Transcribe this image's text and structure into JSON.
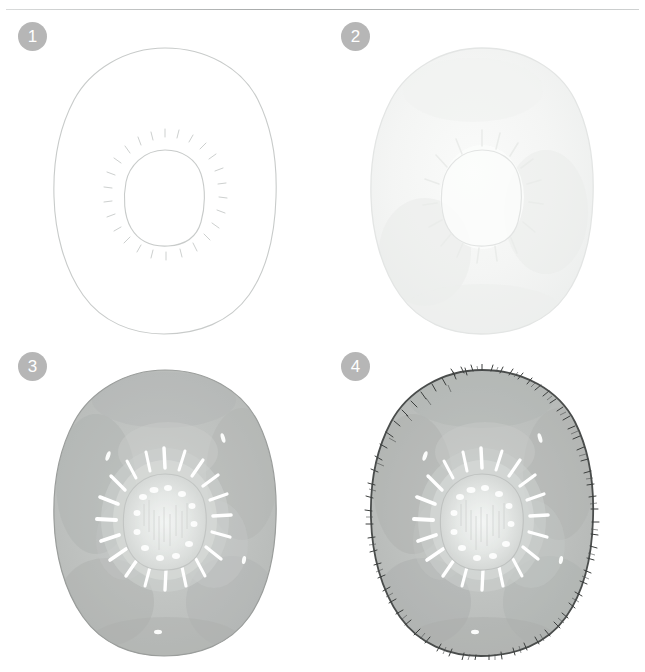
{
  "page": {
    "background_color": "#ffffff",
    "width": 645,
    "height": 672,
    "rule_color": "#b0b3b3"
  },
  "badge": {
    "background_color": "#b6b6b6",
    "text_color": "#ffffff"
  },
  "palette": {
    "pencil_outline": "#c9cccb",
    "wash_step2": "#f2f3f2",
    "wash_step3": "#b9bcba",
    "wash_step4": "#b6b9b7",
    "core_light": "#e9ebea",
    "seed_white": "#ffffff",
    "fuzz_dark": "#3a3d3c"
  },
  "steps": [
    {
      "number": "1",
      "name": "pencil-sketch",
      "label": "Step 1",
      "description": "Light pencil outline of kiwi slice with inner core and seed ticks",
      "has_wash": false,
      "wash_opacity": 0,
      "has_fuzz": false
    },
    {
      "number": "2",
      "name": "first-wash",
      "label": "Step 2",
      "description": "Very pale first watercolor wash over the whole slice",
      "has_wash": true,
      "wash_opacity": 0.14,
      "has_fuzz": false
    },
    {
      "number": "3",
      "name": "mid-tone-wash",
      "label": "Step 3",
      "description": "Deeper mid-tone wash with lifted white core and radiating seed strokes",
      "has_wash": true,
      "wash_opacity": 1,
      "has_fuzz": false
    },
    {
      "number": "4",
      "name": "fuzzy-edge-detail",
      "label": "Step 4",
      "description": "Final stage adding dark fuzzy skin hairs around the outer edge",
      "has_wash": true,
      "wash_opacity": 1,
      "has_fuzz": true
    }
  ]
}
